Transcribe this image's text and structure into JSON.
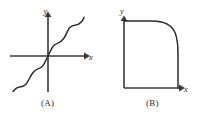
{
  "figure": {
    "background_color": "#ffffff",
    "stroke_color": "#2b2b2b",
    "axis_color": "#3a3a3a",
    "panels": [
      {
        "id": "A",
        "caption": "(A)",
        "x_axis_label": "x",
        "y_axis_label": "y",
        "description": "monotonically increasing wavy curve through the origin",
        "axes": {
          "x_axis": {
            "x1": 10,
            "y1": 56,
            "x2": 84,
            "y2": 56,
            "arrow": "right"
          },
          "y_axis": {
            "x1": 48,
            "y1": 92,
            "x2": 48,
            "y2": 16,
            "arrow": "up"
          },
          "origin": {
            "x": 48,
            "y": 56
          }
        },
        "curve_points": "13,91 18,87 23,86 28,82 33,73 38,68 43,63 48,56 53,49 58,44 63,39 68,30 73,26 78,24 83,17",
        "label_positions": {
          "x_label": {
            "x": 90,
            "y": 59
          },
          "y_label": {
            "x": 45,
            "y": 13
          }
        }
      },
      {
        "id": "B",
        "caption": "(B)",
        "x_axis_label": "x",
        "y_axis_label": "y",
        "description": "superellipse quarter arc forming a rounded square corner in the first quadrant",
        "axes": {
          "x_axis": {
            "x1": 124,
            "y1": 88,
            "x2": 179,
            "y2": 88,
            "arrow": "right"
          },
          "y_axis": {
            "x1": 124,
            "y1": 88,
            "x2": 124,
            "y2": 17,
            "arrow": "up"
          },
          "origin": {
            "x": 124,
            "y": 88
          }
        },
        "curve_top_y": 21,
        "curve_right_x": 178,
        "curve_corner_start_x": 158,
        "curve_corner_end_y": 52,
        "label_positions": {
          "x_label": {
            "x": 185,
            "y": 91
          },
          "y_label": {
            "x": 122,
            "y": 14
          }
        }
      }
    ]
  }
}
